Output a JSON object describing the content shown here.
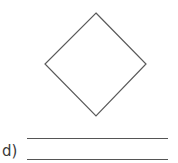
{
  "question": {
    "label": "d)",
    "shape": "square-rotated-45 (diamond)",
    "answer_lines": 2
  },
  "colors": {
    "stroke": "#555555",
    "text": "#3a3a3a",
    "background": "#ffffff"
  }
}
